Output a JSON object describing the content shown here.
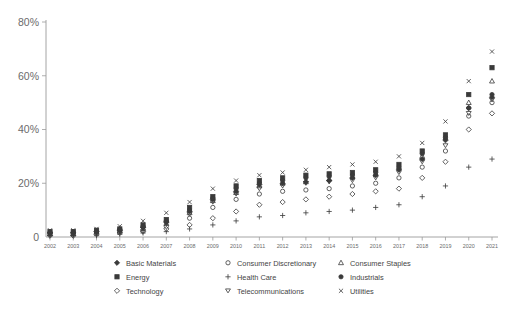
{
  "chart_data": {
    "type": "scatter",
    "title": "",
    "xlabel": "",
    "ylabel": "",
    "ylim": [
      0,
      80
    ],
    "yunit": "%",
    "grid": false,
    "legend_position": "bottom",
    "ytick_labels": [
      "0",
      "20%",
      "40%",
      "60%",
      "80%"
    ],
    "ytick_values": [
      0,
      20,
      40,
      60,
      80
    ],
    "categories": [
      "2002",
      "2003",
      "2004",
      "2005",
      "2006",
      "2007",
      "2008",
      "2009",
      "2010",
      "2011",
      "2012",
      "2013",
      "2014",
      "2015",
      "2016",
      "2017",
      "2018",
      "2019",
      "2020",
      "2021"
    ],
    "series": [
      {
        "name": "Basic Materials",
        "marker": "filled-diamond",
        "values": [
          1.5,
          1.5,
          2,
          2.5,
          3.5,
          5.5,
          9.5,
          14,
          17,
          19.5,
          20,
          20.5,
          21,
          22,
          23,
          25,
          29,
          36,
          48,
          52
        ]
      },
      {
        "name": "Energy",
        "marker": "filled-square",
        "values": [
          2,
          2,
          2.5,
          3,
          4.5,
          6.5,
          11,
          15,
          19,
          21,
          22,
          23,
          23.5,
          24,
          25,
          27,
          32,
          38,
          53,
          63
        ]
      },
      {
        "name": "Technology",
        "marker": "open-diamond",
        "values": [
          0.5,
          0.5,
          1,
          1.5,
          2,
          3,
          4.5,
          7,
          9.5,
          12,
          13,
          14,
          15,
          16,
          17,
          18,
          22,
          28,
          40,
          46
        ]
      },
      {
        "name": "Consumer Discretionary",
        "marker": "open-circle",
        "values": [
          1,
          1,
          1.5,
          2,
          2.5,
          4,
          7,
          11,
          14,
          16,
          17,
          17.5,
          18,
          19,
          20,
          22,
          26,
          32,
          45,
          50
        ]
      },
      {
        "name": "Health Care",
        "marker": "plus",
        "values": [
          0.5,
          0.5,
          0.5,
          1,
          1.5,
          2,
          3,
          4.5,
          6,
          7.5,
          8,
          9,
          9.5,
          10,
          11,
          12,
          15,
          19,
          26,
          29
        ]
      },
      {
        "name": "Telecommunications",
        "marker": "down-triangle",
        "values": [
          1,
          1,
          1.5,
          2,
          3,
          5,
          8.5,
          13,
          16,
          18,
          19,
          20,
          20.5,
          21,
          22,
          24,
          28,
          34,
          46,
          51
        ]
      },
      {
        "name": "Consumer Staples",
        "marker": "open-triangle",
        "values": [
          1.2,
          1.2,
          1.8,
          2.2,
          3.2,
          5,
          9,
          13.5,
          16.5,
          19,
          20,
          20.5,
          21.5,
          22.5,
          23.5,
          26,
          30,
          37,
          50,
          58
        ]
      },
      {
        "name": "Industrials",
        "marker": "filled-circle",
        "values": [
          1.8,
          1.8,
          2.2,
          2.8,
          4,
          6,
          10,
          14.5,
          18,
          20,
          21,
          22,
          22.5,
          23,
          24,
          26,
          31,
          37,
          48,
          53
        ]
      },
      {
        "name": "Utilities",
        "marker": "cross-x",
        "values": [
          2.5,
          2.5,
          3,
          4,
          6,
          9,
          13,
          18,
          21,
          23,
          24,
          25,
          26,
          27,
          28,
          30,
          35,
          43,
          58,
          69
        ]
      }
    ]
  },
  "legend": {
    "columns": [
      [
        {
          "label": "Basic Materials",
          "marker": "filled-diamond"
        },
        {
          "label": "Energy",
          "marker": "filled-square"
        },
        {
          "label": "Technology",
          "marker": "open-diamond"
        }
      ],
      [
        {
          "label": "Consumer Discretionary",
          "marker": "open-circle"
        },
        {
          "label": "Health Care",
          "marker": "plus"
        },
        {
          "label": "Telecommunications",
          "marker": "down-triangle"
        }
      ],
      [
        {
          "label": "Consumer Staples",
          "marker": "open-triangle"
        },
        {
          "label": "Industrials",
          "marker": "filled-circle"
        },
        {
          "label": "Utilities",
          "marker": "cross-x"
        }
      ]
    ]
  },
  "colors": {
    "background": "#ffffff",
    "axis": "#9a9a9a",
    "marker": "#3a3a3a",
    "text": "#5a5a5a"
  }
}
